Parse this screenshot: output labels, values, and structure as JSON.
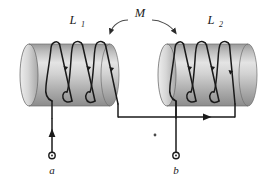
{
  "figure": {
    "background_color": "#ffffff",
    "line_color": "#1a1a1a",
    "cylinder_light": "#e8e8e8",
    "cylinder_mid": "#c9c9c9",
    "cylinder_dark": "#8f8f8f",
    "cylinder_edge": "#6f6f6f"
  },
  "labels": {
    "inductor_left": "L",
    "inductor_left_sub": "1",
    "inductor_right": "L",
    "inductor_right_sub": "2",
    "mutual": "M",
    "terminal_left": "a",
    "terminal_right": "b"
  },
  "elements": {
    "coil_left_name": "solenoid-L1",
    "coil_right_name": "solenoid-L2",
    "mutual_arrow_left": "mutual-arrow-to-L1",
    "mutual_arrow_right": "mutual-arrow-to-L2",
    "current_arrow_terminal_a": "current-arrow-up-at-a",
    "current_arrow_bottom_wire": "current-arrow-right-bottom-wire",
    "dot_marker": "polarity-dot"
  }
}
